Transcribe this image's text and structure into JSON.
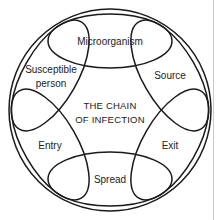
{
  "diagram": {
    "title": "The Chain of Infection",
    "center_text": {
      "line1": "THE CHAIN",
      "line2": "OF INFECTION"
    },
    "stroke_color": "#1a1a1a",
    "text_color": "#222222",
    "background_color": "#ffffff",
    "nodes": [
      {
        "id": "microorganism",
        "label": "Microorganism",
        "label_lines": [
          "Microorganism"
        ],
        "position": "top",
        "angle_deg": 0
      },
      {
        "id": "source",
        "label": "Source",
        "label_lines": [
          "Source"
        ],
        "position": "upper-right",
        "angle_deg": 60
      },
      {
        "id": "exit",
        "label": "Exit",
        "label_lines": [
          "Exit"
        ],
        "position": "lower-right",
        "angle_deg": 120
      },
      {
        "id": "spread",
        "label": "Spread",
        "label_lines": [
          "Spread"
        ],
        "position": "bottom",
        "angle_deg": 180
      },
      {
        "id": "entry",
        "label": "Entry",
        "label_lines": [
          "Entry"
        ],
        "position": "lower-left",
        "angle_deg": 240
      },
      {
        "id": "susceptible-person",
        "label": "Susceptible person",
        "label_lines": [
          "Susceptible",
          "person"
        ],
        "position": "upper-left",
        "angle_deg": 300
      }
    ]
  }
}
